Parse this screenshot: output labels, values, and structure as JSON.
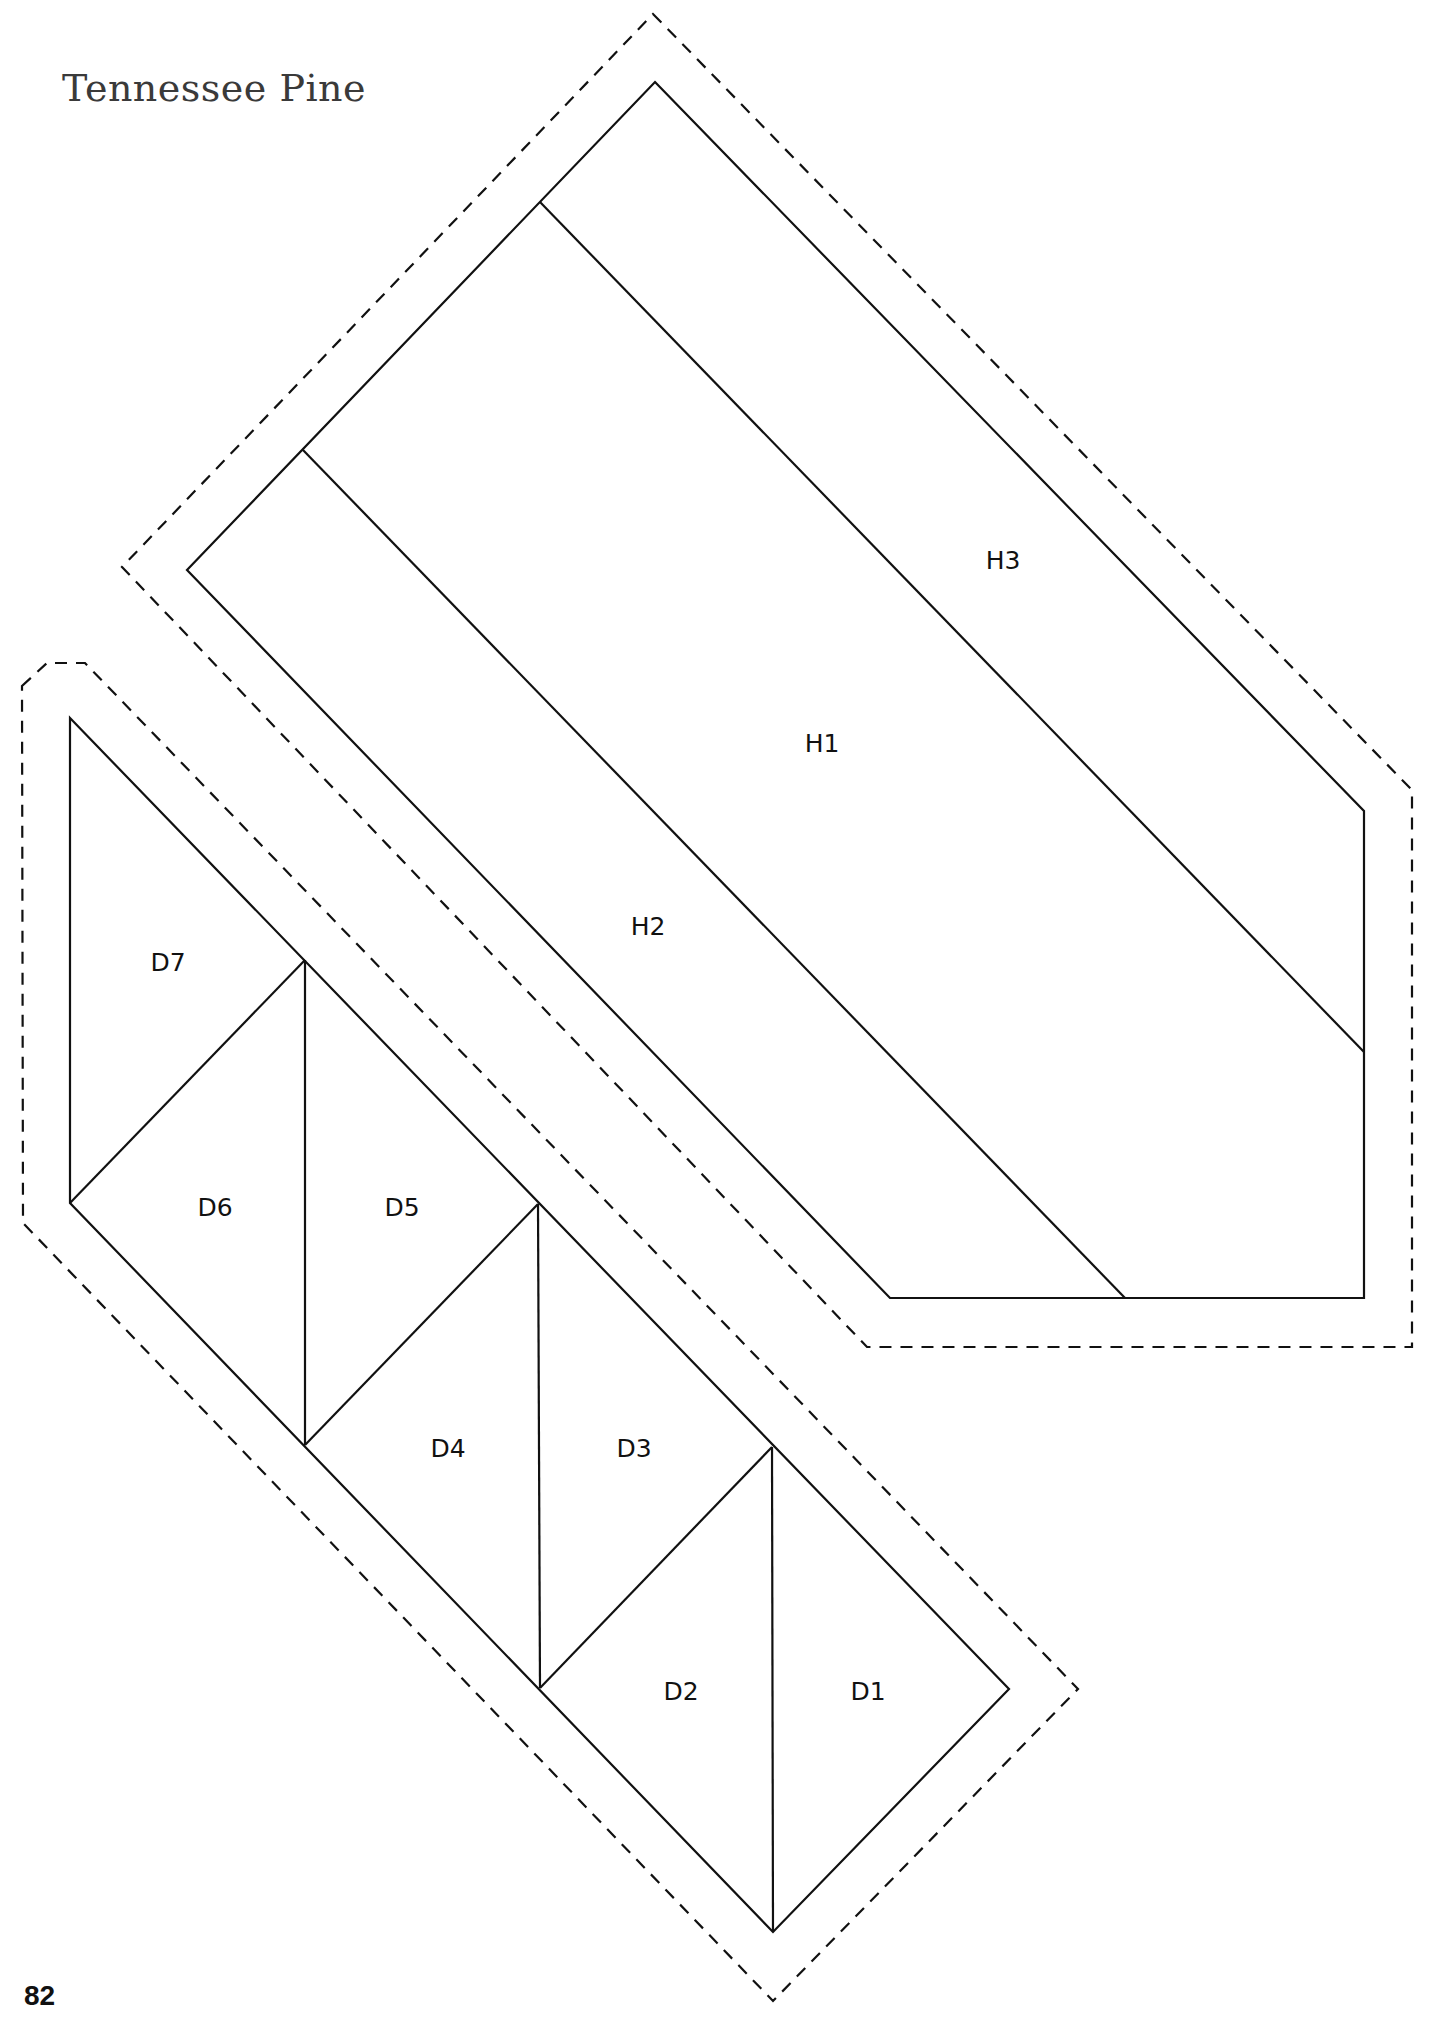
{
  "page": {
    "title": "Tennessee Pine",
    "page_number": "82"
  },
  "pattern": {
    "sections": {
      "H": {
        "pieces": [
          {
            "id": "H1",
            "label": "H1",
            "x": 822,
            "y": 745
          },
          {
            "id": "H2",
            "label": "H2",
            "x": 648,
            "y": 928
          },
          {
            "id": "H3",
            "label": "H3",
            "x": 1003,
            "y": 562
          }
        ]
      },
      "D": {
        "pieces": [
          {
            "id": "D1",
            "label": "D1",
            "x": 868,
            "y": 1693
          },
          {
            "id": "D2",
            "label": "D2",
            "x": 681,
            "y": 1693
          },
          {
            "id": "D3",
            "label": "D3",
            "x": 634,
            "y": 1450
          },
          {
            "id": "D4",
            "label": "D4",
            "x": 448,
            "y": 1450
          },
          {
            "id": "D5",
            "label": "D5",
            "x": 402,
            "y": 1209
          },
          {
            "id": "D6",
            "label": "D6",
            "x": 215,
            "y": 1209
          },
          {
            "id": "D7",
            "label": "D7",
            "x": 168,
            "y": 964
          }
        ]
      }
    },
    "line_color": "#111111",
    "seam_allowance_style": "dashed"
  }
}
